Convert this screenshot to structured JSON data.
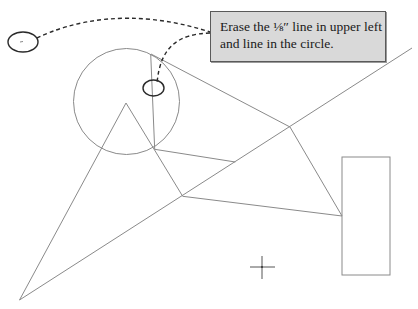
{
  "callout": {
    "line1": "Erase the ⅛″ line in upper left",
    "line2": "and line in the circle."
  },
  "colors": {
    "geometry_stroke": "#8a8a8a",
    "annotation_stroke": "#2a2a2a",
    "callout_fill": "#d9d9d9",
    "callout_border": "#5a5a5a",
    "background": "#ffffff"
  },
  "drawing": {
    "circle": {
      "cx": 126.5,
      "cy": 101.5,
      "r": 53
    },
    "triangle_apex": [
      126,
      103
    ],
    "bottom_left_vertex": [
      19.5,
      300
    ],
    "junction_a": [
      154.7,
      149.3
    ],
    "junction_b": [
      182.7,
      196.3
    ],
    "vertex_c": [
      290,
      127
    ],
    "rect_attach_d": [
      342,
      216
    ],
    "rectangle": {
      "x": 342,
      "y": 157,
      "width": 48,
      "height": 118
    },
    "crosshair": [
      262,
      267
    ],
    "marker_upper_left": {
      "cx": 23,
      "cy": 42,
      "rx": 15,
      "ry": 10
    },
    "marker_in_circle": {
      "cx": 153.5,
      "cy": 88,
      "rx": 10.5,
      "ry": 8
    }
  }
}
